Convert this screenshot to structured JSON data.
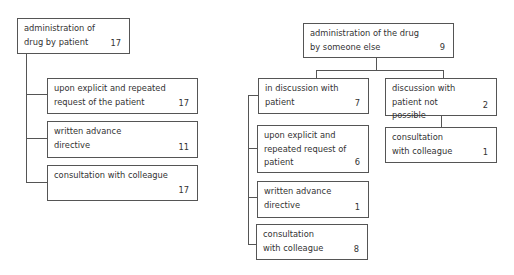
{
  "left_tree": {
    "root": {
      "label": "administration of drug by patient",
      "value": "17"
    },
    "children": [
      {
        "label": "upon explicit and repeated request of the patient",
        "value": "17"
      },
      {
        "label": "written advance directive",
        "value": "11"
      },
      {
        "label": "consultation with colleague",
        "value": "17"
      }
    ]
  },
  "right_tree": {
    "root": {
      "label": "administration of the drug by someone else",
      "value": "9"
    },
    "branches": [
      {
        "label": "in discussion with patient",
        "value": "7",
        "children": [
          {
            "label": "upon explicit and repeated request of patient",
            "value": "6"
          },
          {
            "label": "written advance directive",
            "value": "1"
          },
          {
            "label": "consultation with colleague",
            "value": "8"
          }
        ]
      },
      {
        "label": "discussion with patient not possible",
        "value": "2",
        "children": [
          {
            "label": "consultation with colleague",
            "value": "1"
          }
        ]
      }
    ]
  }
}
